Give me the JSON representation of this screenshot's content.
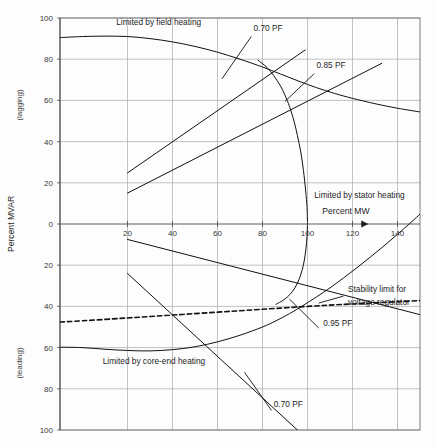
{
  "chart_data": {
    "type": "line",
    "title": "",
    "xlabel": "Percent MW",
    "ylabel": "Percent MVAR",
    "ylabel_upper_note": "(lagging)",
    "ylabel_lower_note": "(leading)",
    "xlim": [
      -10,
      150
    ],
    "ylim": [
      -100,
      100
    ],
    "xticks": [
      20,
      40,
      60,
      80,
      100,
      120,
      140
    ],
    "xtick_labels": [
      "20",
      "40",
      "60",
      "80",
      "100",
      "120",
      "140"
    ],
    "yticks": [
      100,
      80,
      60,
      40,
      20,
      0,
      -20,
      -40,
      -60,
      -80,
      -100
    ],
    "ytick_labels": [
      "100",
      "80",
      "60",
      "40",
      "20",
      "0",
      "20",
      "40",
      "60",
      "80",
      "100"
    ],
    "grid": true,
    "legend": "none",
    "series": [
      {
        "name": "Limited by field heating",
        "style": "solid",
        "points": [
          [
            -10,
            90.5
          ],
          [
            0,
            91.0
          ],
          [
            10,
            91.2
          ],
          [
            20,
            91.0
          ],
          [
            30,
            90.0
          ],
          [
            40,
            88.4
          ],
          [
            50,
            86.2
          ],
          [
            60,
            83.4
          ],
          [
            70,
            80.0
          ],
          [
            80,
            76.2
          ],
          [
            88,
            72.8
          ],
          [
            96,
            69.4
          ],
          [
            104,
            66.2
          ],
          [
            112,
            63.4
          ],
          [
            120,
            61.0
          ],
          [
            130,
            58.4
          ],
          [
            140,
            56.2
          ],
          [
            150,
            54.4
          ]
        ]
      },
      {
        "name": "Limited by stator heating (upper arc)",
        "style": "solid",
        "points": [
          [
            78,
            79.5
          ],
          [
            82,
            76.0
          ],
          [
            85,
            72.0
          ],
          [
            88,
            67.0
          ],
          [
            90,
            62.5
          ],
          [
            92,
            57.0
          ],
          [
            94,
            50.0
          ],
          [
            95.5,
            43.0
          ],
          [
            97,
            35.0
          ],
          [
            98.2,
            26.0
          ],
          [
            99.2,
            16.0
          ],
          [
            99.8,
            8.0
          ],
          [
            100,
            0.0
          ]
        ]
      },
      {
        "name": "Limited by stator heating (lower arc)",
        "style": "solid",
        "points": [
          [
            100,
            0.0
          ],
          [
            99.8,
            -6.0
          ],
          [
            99.3,
            -12.0
          ],
          [
            98.6,
            -17.5
          ],
          [
            97.6,
            -22.5
          ],
          [
            96.2,
            -27.0
          ],
          [
            94.4,
            -31.0
          ],
          [
            92.2,
            -34.2
          ],
          [
            89.5,
            -36.8
          ],
          [
            86.0,
            -39.0
          ]
        ]
      },
      {
        "name": "Limited by core-end heating",
        "style": "solid",
        "points": [
          [
            -10,
            -59.8
          ],
          [
            0,
            -60.0
          ],
          [
            10,
            -60.8
          ],
          [
            20,
            -61.4
          ],
          [
            30,
            -61.6
          ],
          [
            40,
            -61.0
          ],
          [
            50,
            -59.6
          ],
          [
            60,
            -57.2
          ],
          [
            70,
            -54.0
          ],
          [
            80,
            -50.0
          ],
          [
            86,
            -47.0
          ],
          [
            92,
            -43.5
          ],
          [
            98,
            -39.6
          ],
          [
            104,
            -35.4
          ],
          [
            110,
            -31.0
          ],
          [
            116,
            -26.2
          ],
          [
            122,
            -21.2
          ],
          [
            128,
            -16.0
          ],
          [
            134,
            -10.6
          ],
          [
            140,
            -5.0
          ],
          [
            146,
            0.8
          ],
          [
            150,
            4.8
          ]
        ]
      },
      {
        "name": "Stability limit for voltage regulator",
        "style": "dashed",
        "points": [
          [
            -10,
            -47.6
          ],
          [
            0,
            -47.0
          ],
          [
            20,
            -45.6
          ],
          [
            40,
            -44.2
          ],
          [
            60,
            -42.8
          ],
          [
            80,
            -41.4
          ],
          [
            100,
            -40.0
          ],
          [
            120,
            -38.8
          ],
          [
            150,
            -37.2
          ]
        ]
      },
      {
        "name": "0.70 PF lagging",
        "style": "solid",
        "points": [
          [
            20,
            24.8
          ],
          [
            99,
            84.5
          ]
        ]
      },
      {
        "name": "0.85 PF lagging",
        "style": "solid",
        "points": [
          [
            20,
            15.0
          ],
          [
            133,
            78.0
          ]
        ]
      },
      {
        "name": "0.95 PF leading",
        "style": "solid",
        "points": [
          [
            20,
            -7.5
          ],
          [
            150,
            -44.0
          ]
        ]
      },
      {
        "name": "0.70 PF leading",
        "style": "solid",
        "points": [
          [
            20,
            -24.0
          ],
          [
            97,
            -101.5
          ]
        ]
      }
    ],
    "annotations": [
      {
        "id": "field-heating",
        "text": "Limited by field heating",
        "x": 15,
        "y": 96.5,
        "anchor": "start"
      },
      {
        "id": "stator-heating",
        "text": "Limited by stator heating",
        "x": 103,
        "y": 12.5,
        "anchor": "start"
      },
      {
        "id": "core-end-heating",
        "text": "Limited by core-end heating",
        "x": 9,
        "y": -68.0,
        "anchor": "start"
      },
      {
        "id": "pf-070-lagging",
        "text": "0.70 PF",
        "x": 76,
        "y": 93.5,
        "anchor": "start"
      },
      {
        "id": "pf-085-lagging",
        "text": "0.85 PF",
        "x": 104,
        "y": 75.5,
        "anchor": "start"
      },
      {
        "id": "pf-095-leading",
        "text": "0.95 PF",
        "x": 107,
        "y": -49.5,
        "anchor": "start"
      },
      {
        "id": "pf-070-leading",
        "text": "0.70 PF",
        "x": 85,
        "y": -89.0,
        "anchor": "start"
      },
      {
        "id": "stability-limit-1",
        "text": "Stability limit for",
        "x": 118,
        "y": -33.0,
        "anchor": "start"
      },
      {
        "id": "stability-limit-2",
        "text": "voltage regulator",
        "x": 118,
        "y": -39.5,
        "anchor": "start"
      }
    ],
    "leaders": [
      {
        "id": "leader-pf-070-lagging",
        "from": [
          62,
          70.5
        ],
        "to": [
          75,
          91.0
        ]
      },
      {
        "id": "leader-pf-085-lagging",
        "from": [
          90,
          59.5
        ],
        "to": [
          103,
          73.0
        ]
      },
      {
        "id": "leader-pf-095-leading",
        "from": [
          92,
          -36.5
        ],
        "to": [
          105,
          -50.5
        ]
      },
      {
        "id": "leader-pf-070-leading",
        "from": [
          72,
          -72.0
        ],
        "to": [
          84,
          -90.5
        ]
      },
      {
        "id": "leader-stability-limit",
        "from": [
          105,
          -38.4
        ],
        "to": [
          116,
          -35.0
        ]
      }
    ],
    "axis_arrow": {
      "id": "percent-mw-arrow",
      "x_tip": 127,
      "y": 0
    }
  }
}
